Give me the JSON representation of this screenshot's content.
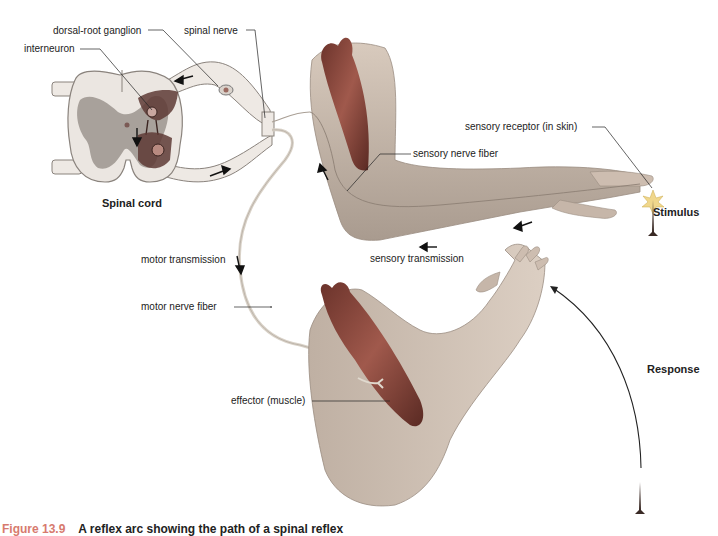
{
  "figure": {
    "caption_number": "Figure 13.9",
    "caption_text": "A reflex arc showing the path of a spinal reflex"
  },
  "labels": {
    "dorsal_root_ganglion": "dorsal-root ganglion",
    "spinal_nerve": "spinal nerve",
    "interneuron": "interneuron",
    "spinal_cord": "Spinal cord",
    "sensory_receptor": "sensory receptor (in skin)",
    "sensory_nerve_fiber": "sensory nerve fiber",
    "stimulus": "Stimulus",
    "sensory_transmission": "sensory transmission",
    "motor_transmission": "motor transmission",
    "motor_nerve_fiber": "motor nerve fiber",
    "effector": "effector (muscle)",
    "response": "Response"
  },
  "colors": {
    "skin": "#cdbdb0",
    "skin_shadow": "#a89a8e",
    "muscle": "#8c4a3f",
    "muscle_dark": "#5e2c25",
    "cord_white": "#e9e4df",
    "cord_gray": "#a49d97",
    "nerve": "#d9d2c8",
    "caption_accent": "#d77a6e"
  }
}
